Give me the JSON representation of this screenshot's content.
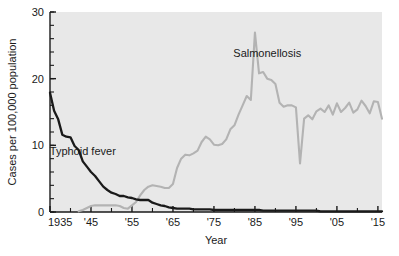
{
  "chart_data": {
    "type": "line",
    "title": "",
    "xlabel": "Year",
    "ylabel": "Cases per 100,000 population",
    "xlim": [
      1935,
      2016
    ],
    "ylim": [
      0,
      30
    ],
    "grid": false,
    "legend_position": "inline-annotations",
    "background_color": "#e8e8e8",
    "x_tick_labels": [
      "1935",
      "'45",
      "'55",
      "'65",
      "'75",
      "'85",
      "'95",
      "'05",
      "'15"
    ],
    "x_tick_values": [
      1935,
      1945,
      1955,
      1965,
      1975,
      1985,
      1995,
      2005,
      2015
    ],
    "y_tick_labels": [
      "0",
      "10",
      "20",
      "30"
    ],
    "y_tick_values": [
      0,
      10,
      20,
      30
    ],
    "y_minor_step": 2,
    "series": [
      {
        "name": "Typhoid fever",
        "color": "#1a1a1a",
        "label_x": 1943,
        "label_y": 8.6,
        "x": [
          1935,
          1936,
          1937,
          1938,
          1939,
          1940,
          1941,
          1942,
          1943,
          1944,
          1945,
          1946,
          1947,
          1948,
          1949,
          1950,
          1951,
          1952,
          1953,
          1954,
          1955,
          1956,
          1957,
          1958,
          1959,
          1960,
          1961,
          1962,
          1963,
          1964,
          1965,
          1966,
          1967,
          1968,
          1969,
          1970,
          1971,
          1972,
          1973,
          1974,
          1975,
          1976,
          1977,
          1978,
          1979,
          1980,
          1981,
          1982,
          1983,
          1984,
          1985,
          1986,
          1987,
          1988,
          1989,
          1990,
          1991,
          1992,
          1993,
          1994,
          1995,
          1996,
          1997,
          1998,
          1999,
          2000,
          2001,
          2002,
          2003,
          2004,
          2005,
          2006,
          2007,
          2008,
          2009,
          2010,
          2011,
          2012,
          2013,
          2014,
          2015,
          2016
        ],
        "values": [
          17.9,
          15.2,
          13.9,
          11.6,
          11.3,
          11.2,
          9.9,
          9.3,
          7.6,
          6.8,
          6.0,
          5.4,
          4.6,
          3.8,
          3.3,
          2.9,
          2.7,
          2.4,
          2.4,
          2.2,
          2.1,
          1.9,
          1.8,
          1.8,
          1.8,
          1.4,
          1.2,
          1.0,
          0.9,
          0.7,
          0.6,
          0.5,
          0.5,
          0.5,
          0.5,
          0.4,
          0.4,
          0.4,
          0.4,
          0.4,
          0.3,
          0.3,
          0.3,
          0.3,
          0.3,
          0.3,
          0.3,
          0.3,
          0.3,
          0.3,
          0.3,
          0.3,
          0.2,
          0.2,
          0.2,
          0.2,
          0.2,
          0.2,
          0.2,
          0.2,
          0.2,
          0.2,
          0.2,
          0.2,
          0.2,
          0.2,
          0.1,
          0.1,
          0.1,
          0.1,
          0.1,
          0.1,
          0.1,
          0.1,
          0.1,
          0.1,
          0.1,
          0.1,
          0.1,
          0.1,
          0.1,
          0.1
        ]
      },
      {
        "name": "Salmonellosis",
        "color": "#b3b3b3",
        "label_x": 1988,
        "label_y": 23.2,
        "x": [
          1942,
          1943,
          1944,
          1945,
          1946,
          1947,
          1948,
          1949,
          1950,
          1951,
          1952,
          1953,
          1954,
          1955,
          1956,
          1957,
          1958,
          1959,
          1960,
          1961,
          1962,
          1963,
          1964,
          1965,
          1966,
          1967,
          1968,
          1969,
          1970,
          1971,
          1972,
          1973,
          1974,
          1975,
          1976,
          1977,
          1978,
          1979,
          1980,
          1981,
          1982,
          1983,
          1984,
          1985,
          1986,
          1987,
          1988,
          1989,
          1990,
          1991,
          1992,
          1993,
          1994,
          1995,
          1996,
          1997,
          1998,
          1999,
          2000,
          2001,
          2002,
          2003,
          2004,
          2005,
          2006,
          2007,
          2008,
          2009,
          2010,
          2011,
          2012,
          2013,
          2014,
          2015,
          2016
        ],
        "values": [
          0.1,
          0.3,
          0.6,
          0.9,
          1.0,
          1.0,
          1.0,
          1.0,
          1.0,
          1.0,
          0.9,
          0.6,
          0.5,
          1.0,
          1.5,
          2.5,
          3.3,
          3.8,
          4.0,
          3.9,
          3.8,
          3.6,
          3.6,
          4.2,
          6.6,
          8.0,
          8.6,
          8.5,
          8.8,
          9.2,
          10.5,
          11.3,
          10.9,
          10.1,
          10.0,
          10.2,
          10.9,
          12.4,
          13.0,
          14.6,
          16.0,
          17.4,
          16.8,
          26.9,
          20.8,
          21.0,
          20.0,
          19.8,
          19.2,
          16.4,
          15.8,
          16.0,
          16.0,
          15.7,
          7.3,
          14.0,
          14.5,
          13.9,
          15.1,
          15.5,
          15.0,
          16.0,
          14.6,
          16.3,
          15.0,
          15.6,
          16.4,
          14.9,
          15.4,
          16.7,
          15.9,
          14.8,
          16.6,
          16.5,
          14.0
        ]
      }
    ],
    "annotations": [
      {
        "text": "Salmonellosis",
        "x": 1988,
        "y": 23.2
      },
      {
        "text": "Typhoid fever",
        "x": 1943,
        "y": 8.6
      }
    ]
  }
}
